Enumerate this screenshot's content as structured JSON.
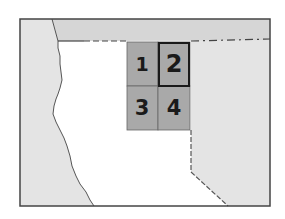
{
  "map": {
    "type": "locator-map",
    "colors": {
      "background": "#ffffff",
      "land_neighbor": "#e2e2e2",
      "land_neighbor_top": "#d8d8d8",
      "focus_area": "#ffffff",
      "grid_cell": "#a9a9a9",
      "highlight_border": "#1a1a1a",
      "frame": "#444444"
    },
    "grid": {
      "cells": [
        {
          "id": "1",
          "label": "1",
          "highlighted": false
        },
        {
          "id": "2",
          "label": "2",
          "highlighted": true
        },
        {
          "id": "3",
          "label": "3",
          "highlighted": false
        },
        {
          "id": "4",
          "label": "4",
          "highlighted": false
        }
      ]
    }
  }
}
